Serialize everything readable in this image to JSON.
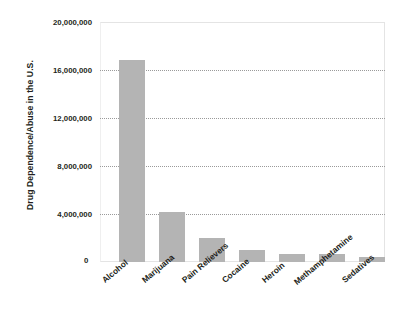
{
  "chart_data": {
    "type": "bar",
    "title": "",
    "xlabel": "",
    "ylabel": "Drug Dependence/Abuse in the U.S.",
    "categories": [
      "Alcohol",
      "Marijuana",
      "Pain Relievers",
      "Cocaine",
      "Heroin",
      "Methamphetamine",
      "Sedatives"
    ],
    "values": [
      16800000,
      4200000,
      2000000,
      1000000,
      650000,
      650000,
      400000
    ],
    "ylim": [
      0,
      20000000
    ],
    "ytick_labels": [
      "20,000,000",
      "16,000,000",
      "12,000,000",
      "8,000,000",
      "4,000,000",
      "0"
    ],
    "ytick_values": [
      20000000,
      16000000,
      12000000,
      8000000,
      4000000,
      0
    ],
    "gridlines_at": [
      16000000,
      12000000,
      8000000,
      4000000
    ],
    "grid": true,
    "legend": "none",
    "bar_color": "#b4b4b4",
    "grid_color": "#9a9a9a",
    "frame_color": "#e4e4e4",
    "text_color": "#231f20"
  }
}
